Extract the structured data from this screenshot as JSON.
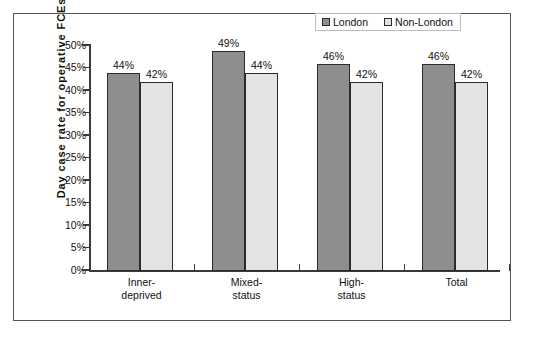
{
  "chart_data": {
    "type": "bar",
    "title": "",
    "subtitle": "",
    "xlabel": "",
    "ylabel": "Day case rate for operative FCEs",
    "categories": [
      "Inner-deprived",
      "Mixed-status",
      "High-status",
      "Total"
    ],
    "category_lines": [
      [
        "Inner-",
        "deprived"
      ],
      [
        "Mixed-",
        "status"
      ],
      [
        "High-",
        "status"
      ],
      [
        "Total",
        ""
      ]
    ],
    "series": [
      {
        "name": "London",
        "color": "#8e8e8e",
        "values": [
          44,
          49,
          46,
          46
        ],
        "labels": [
          "44%",
          "49%",
          "46%",
          "46%"
        ]
      },
      {
        "name": "Non-London",
        "color": "#e3e3e3",
        "values": [
          42,
          44,
          42,
          42
        ],
        "labels": [
          "42%",
          "44%",
          "42%",
          "42%"
        ]
      }
    ],
    "ylim": [
      0,
      50
    ],
    "ytick_values": [
      0,
      5,
      10,
      15,
      20,
      25,
      30,
      35,
      40,
      45,
      50
    ],
    "ytick_labels": [
      "0%",
      "5%",
      "10%",
      "15%",
      "20%",
      "25%",
      "30%",
      "35%",
      "40%",
      "45%",
      "50%"
    ],
    "grid": false,
    "legend_position": "top-right",
    "legend_entries": [
      "London",
      "Non-London"
    ],
    "colors": {
      "london": "#8e8e8e",
      "non_london": "#e3e3e3",
      "bar_outline": "#2b2b2b",
      "axis": "#3a3a3a",
      "frame": "#555555",
      "text": "#111111",
      "background": "#ffffff"
    }
  }
}
